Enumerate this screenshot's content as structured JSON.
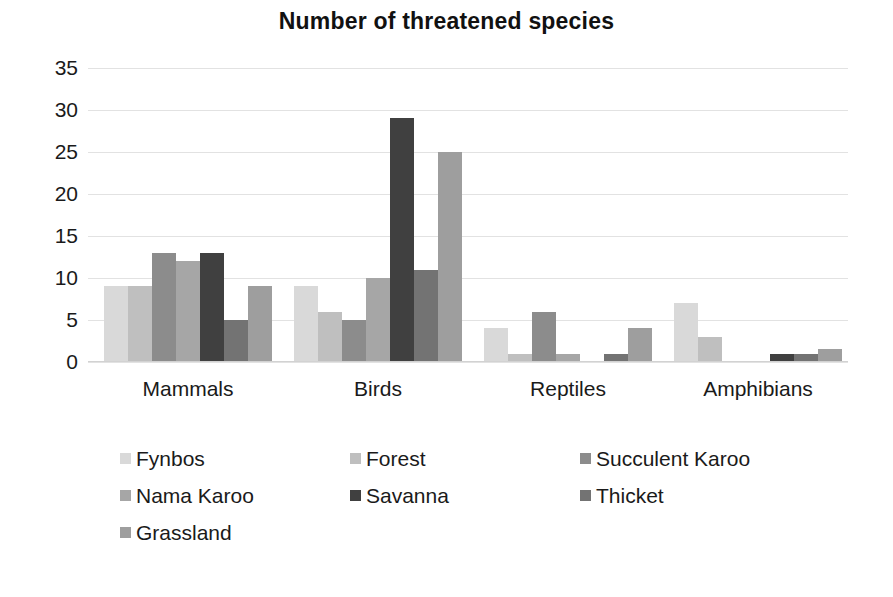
{
  "chart_data": {
    "type": "bar",
    "title": "Number of threatened species",
    "xlabel": "",
    "ylabel": "",
    "ylim": [
      0,
      35
    ],
    "ytick_step": 5,
    "yticks": [
      35,
      30,
      25,
      20,
      15,
      10,
      5,
      0
    ],
    "grid": true,
    "legend_position": "bottom",
    "categories": [
      "Mammals",
      "Birds",
      "Reptiles",
      "Amphibians"
    ],
    "series": [
      {
        "name": "Fynbos",
        "color": "#d9d9d9",
        "values": [
          9,
          9,
          4,
          7
        ]
      },
      {
        "name": "Forest",
        "color": "#bfbfbf",
        "values": [
          9,
          6,
          1,
          3
        ]
      },
      {
        "name": "Succulent Karoo",
        "color": "#8c8c8c",
        "values": [
          13,
          5,
          6,
          0
        ]
      },
      {
        "name": "Nama Karoo",
        "color": "#a6a6a6",
        "values": [
          12,
          10,
          1,
          0
        ]
      },
      {
        "name": "Savanna",
        "color": "#404040",
        "values": [
          13,
          29,
          0,
          1
        ]
      },
      {
        "name": "Thicket",
        "color": "#737373",
        "values": [
          5,
          11,
          1,
          1
        ]
      },
      {
        "name": "Grassland",
        "color": "#9e9e9e",
        "values": [
          9,
          25,
          4,
          1.5
        ]
      }
    ]
  },
  "colors": {
    "background": "#ffffff",
    "gridline": "#e2e2e2",
    "text": "#1a1a1a"
  }
}
